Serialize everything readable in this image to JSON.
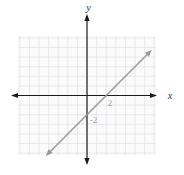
{
  "figure": {
    "kind": "coordinate-plane-line-graph",
    "labels": {
      "x_axis": "x",
      "y_axis": "y",
      "x_tick": "2",
      "y_tick": "-2"
    },
    "colors": {
      "axis": "#1a1a1a",
      "line": "#999999",
      "grid_line": "#e3e3e3",
      "grid_bg": "#fbfbfb",
      "tick_label": "#9b9b9b",
      "axis_label": "#3a3a3a"
    }
  },
  "chart_data": {
    "type": "line",
    "title": "",
    "equation": "y = x - 2",
    "xlabel": "x",
    "ylabel": "y",
    "x_range": [
      -7.2,
      7.15
    ],
    "y_range": [
      -6.15,
      6.2
    ],
    "grid": true,
    "grid_step": 1,
    "labeled_ticks": {
      "x": [
        2
      ],
      "y": [
        -2
      ]
    },
    "series": [
      {
        "name": "y = x - 2",
        "slope": 1,
        "y_intercept": -2,
        "points": [
          {
            "x": 0,
            "y": -2
          },
          {
            "x": 2,
            "y": 0
          }
        ],
        "x_span": [
          -4.3,
          6.75
        ],
        "color": "#999999"
      }
    ]
  }
}
